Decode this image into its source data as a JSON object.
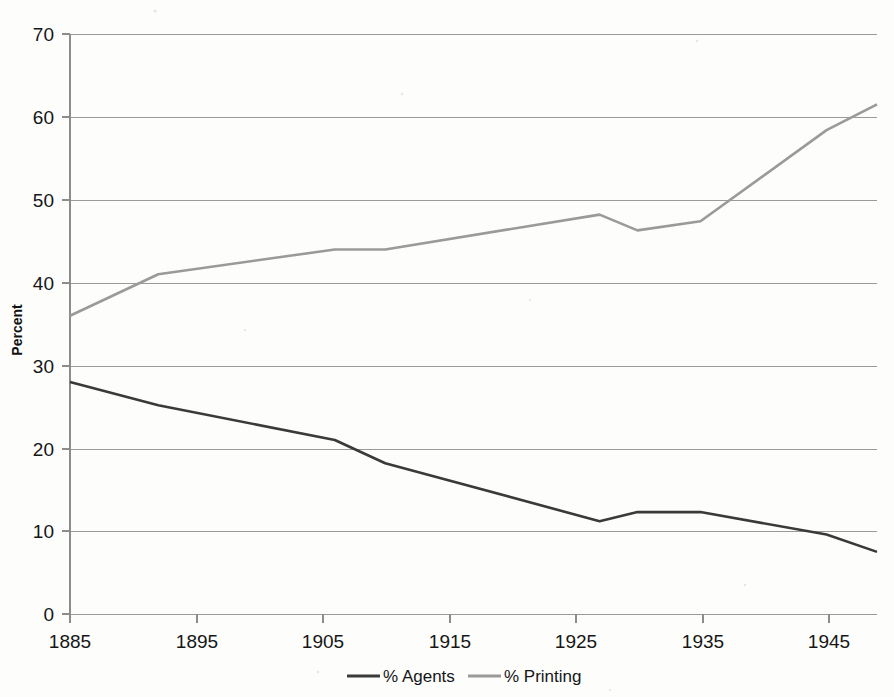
{
  "chart_data": {
    "type": "line",
    "title": "",
    "subtitle": "",
    "xlabel": "",
    "ylabel": "Percent",
    "xlim": [
      1885,
      1949
    ],
    "ylim": [
      0,
      70
    ],
    "x_ticks": [
      1885,
      1895,
      1905,
      1915,
      1925,
      1935,
      1945
    ],
    "y_ticks": [
      0,
      10,
      20,
      30,
      40,
      50,
      60,
      70
    ],
    "grid": "horizontal",
    "legend_position": "bottom-center",
    "series": [
      {
        "name": "% Agents",
        "color": "#3a3a3a",
        "points": [
          [
            1885,
            28.0
          ],
          [
            1892,
            25.2
          ],
          [
            1906,
            21.0
          ],
          [
            1910,
            18.2
          ],
          [
            1927,
            11.2
          ],
          [
            1930,
            12.3
          ],
          [
            1935,
            12.3
          ],
          [
            1945,
            9.6
          ],
          [
            1949,
            7.5
          ]
        ]
      },
      {
        "name": "% Printing",
        "color": "#9a9a9a",
        "points": [
          [
            1885,
            36.0
          ],
          [
            1892,
            41.0
          ],
          [
            1906,
            44.0
          ],
          [
            1910,
            44.0
          ],
          [
            1927,
            48.2
          ],
          [
            1930,
            46.3
          ],
          [
            1935,
            47.4
          ],
          [
            1945,
            58.4
          ],
          [
            1949,
            61.5
          ]
        ]
      }
    ]
  },
  "axis": {
    "y_title": "Percent",
    "y_tick_labels": [
      "70",
      "60",
      "50",
      "40",
      "30",
      "20",
      "10",
      "0"
    ],
    "x_tick_labels": [
      "1885",
      "1895",
      "1905",
      "1915",
      "1925",
      "1935",
      "1945"
    ]
  },
  "legend": {
    "items": [
      {
        "label": "% Agents",
        "color": "#3a3a3a"
      },
      {
        "label": "% Printing",
        "color": "#9a9a9a"
      }
    ]
  }
}
